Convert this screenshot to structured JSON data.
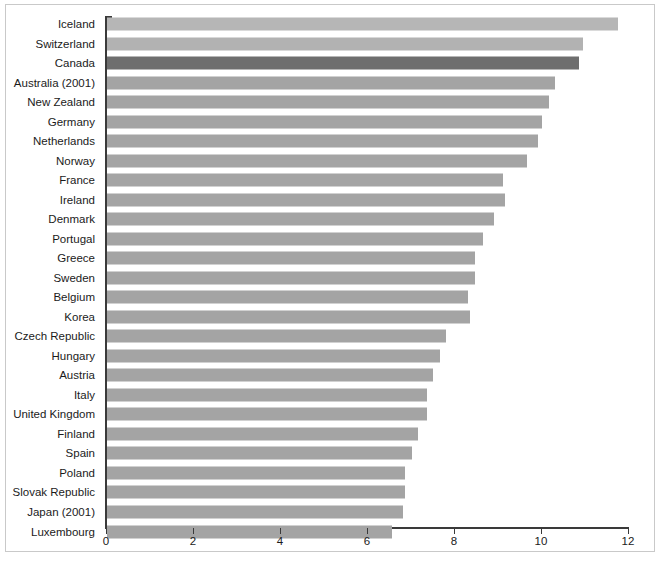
{
  "chart_data": {
    "type": "bar",
    "orientation": "horizontal",
    "title": "",
    "subtitle": "",
    "xlabel": "",
    "ylabel": "",
    "xlim": [
      0,
      12
    ],
    "xticks": [
      0,
      2,
      4,
      6,
      8,
      10,
      12
    ],
    "xtick_labels": [
      "0",
      "2",
      "4",
      "6",
      "8",
      "10",
      "12"
    ],
    "grid": false,
    "legend": false,
    "highlight_category": "Canada",
    "categories": [
      "Iceland",
      "Switzerland",
      "Canada",
      "Australia (2001)",
      "New Zealand",
      "Germany",
      "Netherlands",
      "Norway",
      "France",
      "Ireland",
      "Denmark",
      "Portugal",
      "Greece",
      "Sweden",
      "Belgium",
      "Korea",
      "Czech Republic",
      "Hungary",
      "Austria",
      "Italy",
      "United Kingdom",
      "Finland",
      "Spain",
      "Poland",
      "Slovak Republic",
      "Japan (2001)",
      "Luxembourg"
    ],
    "values": [
      11.75,
      10.95,
      10.85,
      10.3,
      10.15,
      10.0,
      9.9,
      9.65,
      9.1,
      9.15,
      8.9,
      8.65,
      8.45,
      8.45,
      8.3,
      8.35,
      7.8,
      7.65,
      7.5,
      7.35,
      7.35,
      7.15,
      7.0,
      6.85,
      6.85,
      6.8,
      6.55
    ],
    "bar_colors": [
      "#b6b6b6",
      "#b2b2b2",
      "#6e6e6e",
      "#a4a4a4",
      "#a4a4a4",
      "#a4a4a4",
      "#a4a4a4",
      "#a4a4a4",
      "#a4a4a4",
      "#a4a4a4",
      "#a4a4a4",
      "#a4a4a4",
      "#a4a4a4",
      "#a4a4a4",
      "#a4a4a4",
      "#a4a4a4",
      "#a4a4a4",
      "#a4a4a4",
      "#a4a4a4",
      "#a4a4a4",
      "#a4a4a4",
      "#a4a4a4",
      "#a4a4a4",
      "#a4a4a4",
      "#a4a4a4",
      "#a4a4a4",
      "#a4a4a4"
    ]
  },
  "colors": {
    "bar_default": "#a4a4a4",
    "bar_highlight": "#6e6e6e",
    "axis": "#3a3a3a",
    "text": "#1b1b1b",
    "frame": "#c9c9c9",
    "background": "#ffffff"
  }
}
